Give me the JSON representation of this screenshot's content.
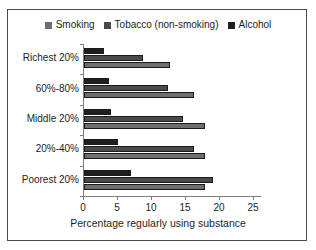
{
  "chart_data": {
    "type": "bar",
    "orientation": "horizontal",
    "title": "",
    "xlabel": "Percentage regularly using substance",
    "ylabel": "",
    "xlim": [
      0,
      25
    ],
    "xticks": [
      0,
      5,
      10,
      15,
      20,
      25
    ],
    "grid": false,
    "legend_position": "top-center",
    "categories": [
      "Richest 20%",
      "60%-80%",
      "Middle 20%",
      "20%-40%",
      "Poorest 20%"
    ],
    "series": [
      {
        "name": "Smoking",
        "color": "#6e6e6e",
        "values": [
          12.7,
          16.2,
          17.8,
          17.8,
          17.8
        ]
      },
      {
        "name": "Tobacco (non-smoking)",
        "color": "#4a4a4a",
        "values": [
          8.7,
          12.3,
          14.5,
          16.2,
          19.0
        ]
      },
      {
        "name": "Alcohol",
        "color": "#1f1f1f",
        "values": [
          3.0,
          3.7,
          4.0,
          5.0,
          6.9
        ]
      }
    ]
  },
  "axis": {
    "tick_labels": [
      "0",
      "5",
      "10",
      "15",
      "20",
      "25"
    ]
  },
  "colors": {
    "frame_border": "#4a4a4a",
    "axis_line": "#7d7d7d",
    "text": "#1d1d1d",
    "background": "#ffffff"
  }
}
